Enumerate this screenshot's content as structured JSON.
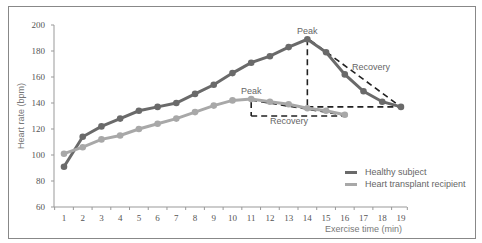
{
  "chart_data": {
    "type": "line",
    "title": "",
    "xlabel": "Exercise time (min)",
    "ylabel": "Heart rate (bpm)",
    "x": [
      1,
      2,
      3,
      4,
      5,
      6,
      7,
      8,
      9,
      10,
      11,
      12,
      13,
      14,
      15,
      16,
      17,
      18,
      19
    ],
    "ylim": [
      60,
      200
    ],
    "yticks": [
      60,
      80,
      100,
      120,
      140,
      160,
      180,
      200
    ],
    "grid": false,
    "legend_position": "lower right",
    "series": [
      {
        "name": "Healthy subject",
        "color": "#6a6a6a",
        "values": [
          91,
          114,
          122,
          128,
          134,
          137,
          140,
          147,
          154,
          163,
          171,
          176,
          183,
          189,
          179,
          162,
          149,
          141,
          137
        ]
      },
      {
        "name": "Heart transplant recipient",
        "color": "#a8a8a8",
        "values": [
          101,
          106,
          112,
          115,
          120,
          124,
          128,
          133,
          138,
          142,
          143,
          141,
          139,
          136,
          134,
          131,
          null,
          null,
          null
        ]
      }
    ],
    "annotations": [
      {
        "text": "Peak",
        "series": "Healthy subject",
        "x": 14
      },
      {
        "text": "Recovery",
        "series": "Healthy subject",
        "from_x": 14,
        "to_x": 19
      },
      {
        "text": "Peak",
        "series": "Heart transplant recipient",
        "x": 11
      },
      {
        "text": "Recovery",
        "series": "Heart transplant recipient",
        "from_x": 11,
        "to_x": 16
      }
    ]
  },
  "labels": {
    "ylabel": "Heart rate (bpm)",
    "xlabel": "Exercise time (min)",
    "peak": "Peak",
    "recovery": "Recovery"
  },
  "legend": [
    {
      "label": "Healthy subject",
      "color": "#6a6a6a"
    },
    {
      "label": "Heart transplant recipient",
      "color": "#a8a8a8"
    }
  ]
}
